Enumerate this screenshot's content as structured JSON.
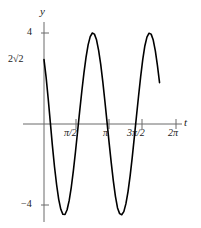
{
  "figure": {
    "axes": {
      "x_axis_label": "t",
      "y_axis_label": "y",
      "x_ticks": [
        {
          "label": "π/2",
          "value": 1.5708
        },
        {
          "label": "π",
          "value": 3.1416
        },
        {
          "label": "3π/2",
          "value": 4.7124
        },
        {
          "label": "2π",
          "value": 6.2832
        }
      ],
      "y_ticks": [
        {
          "label": "4",
          "value": 4
        },
        {
          "label": "2√2",
          "value": 2.828
        },
        {
          "label": "−4",
          "value": -4
        }
      ]
    }
  },
  "chart_data": {
    "type": "line",
    "title": "",
    "xlabel": "t",
    "ylabel": "y",
    "xlim": [
      0,
      6.2832
    ],
    "ylim": [
      -4.4,
      4.4
    ],
    "grid": false,
    "legend": null,
    "annotations": [
      {
        "text": "2√2",
        "x": 0,
        "y": 2.828,
        "note": "y-intercept label"
      },
      {
        "text": "4",
        "x": 0,
        "y": 4,
        "note": "y-axis tick"
      },
      {
        "text": "−4",
        "x": 0,
        "y": -4,
        "note": "y-axis tick"
      }
    ],
    "x_tick_values": [
      1.5708,
      3.1416,
      4.7124,
      6.2832
    ],
    "x_tick_labels": [
      "π/2",
      "π",
      "3π/2",
      "2π"
    ],
    "y_tick_values": [
      4,
      2.828,
      -4
    ],
    "y_tick_labels": [
      "4",
      "2√2",
      "−4"
    ],
    "series": [
      {
        "name": "y = −4 sin(2t − π/4)",
        "amplitude": 4,
        "period": 3.1416,
        "x_start": 0.0,
        "x_end": 5.55,
        "key_points": [
          {
            "x": 0.0,
            "y": 2.83,
            "note": "start at 2√2"
          },
          {
            "x": 0.39,
            "y": 0,
            "note": "descending zero crossing"
          },
          {
            "x": 1.18,
            "y": -4,
            "note": "minimum"
          },
          {
            "x": 1.96,
            "y": 0,
            "note": "ascending zero crossing"
          },
          {
            "x": 2.75,
            "y": 4,
            "note": "local maximum (off-plot shape)"
          },
          {
            "x": 3.93,
            "y": 4,
            "note": "maximum"
          },
          {
            "x": 5.55,
            "y": 2.8,
            "note": "curve end"
          }
        ],
        "x": [
          0.0,
          0.1,
          0.2,
          0.3,
          0.4,
          0.5,
          0.6,
          0.7,
          0.8,
          0.9,
          1.0,
          1.1,
          1.2,
          1.3,
          1.4,
          1.5,
          1.6,
          1.7,
          1.8,
          1.9,
          2.0,
          2.1,
          2.2,
          2.3,
          2.4,
          2.5,
          2.6,
          2.7,
          2.8,
          2.9,
          3.0,
          3.1,
          3.2,
          3.3,
          3.4,
          3.5,
          3.6,
          3.7,
          3.8,
          3.9,
          4.0,
          4.1,
          4.2,
          4.3,
          4.4,
          4.5,
          4.6,
          4.7,
          4.8,
          4.9,
          5.0,
          5.1,
          5.2,
          5.3,
          5.4,
          5.5
        ],
        "y": [
          2.83,
          2.06,
          1.11,
          0.08,
          -0.95,
          -1.88,
          -2.67,
          -3.31,
          -3.75,
          -3.97,
          -3.98,
          -3.77,
          -3.36,
          -2.77,
          -2.04,
          -1.21,
          -0.32,
          0.58,
          1.44,
          2.24,
          2.93,
          3.48,
          3.84,
          4.0,
          3.95,
          3.7,
          3.24,
          2.62,
          1.85,
          0.99,
          0.08,
          -0.83,
          -1.7,
          -2.5,
          -3.18,
          -3.69,
          -3.94,
          -3.99,
          -3.85,
          -3.5,
          -2.97,
          -2.28,
          -1.47,
          -0.58,
          0.33,
          1.22,
          2.07,
          2.83,
          3.43,
          3.82,
          3.99,
          3.95,
          3.69,
          3.21,
          2.57,
          1.82
        ]
      }
    ]
  }
}
